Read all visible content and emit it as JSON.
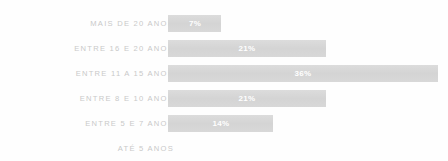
{
  "chart_data": {
    "type": "bar",
    "orientation": "horizontal",
    "title": "",
    "xlabel": "",
    "ylabel": "",
    "grid": false,
    "legend": "none",
    "xlim": [
      0,
      36
    ],
    "categories": [
      "MAIS DE 20 ANOS",
      "ENTRE 16 E 20 ANOS",
      "ENTRE 11 A 15 ANOS",
      "ENTRE 8 E 10 ANOS",
      "ENTRE 5 E 7 ANOS",
      "ATÉ 5 ANOS"
    ],
    "values": [
      7,
      21,
      36,
      21,
      14,
      0
    ],
    "data_labels": [
      "7%",
      "21%",
      "36%",
      "21%",
      "14%",
      ""
    ],
    "bar_color": "#d6d6d6",
    "label_color": "#c9c9c9",
    "value_label_color": "#ffffff",
    "background": "#fefefe"
  }
}
